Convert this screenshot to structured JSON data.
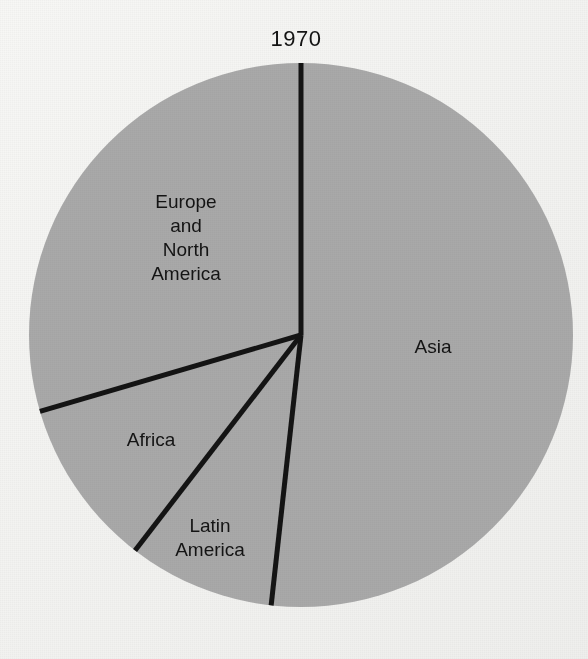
{
  "chart_data": {
    "type": "pie",
    "title": "1970",
    "subtitle": "",
    "xlabel": "",
    "ylabel": "",
    "legend_position": "none",
    "grid": false,
    "labels_inside_slices": true,
    "categories": [
      "Asia",
      "Latin America",
      "Africa",
      "Europe and North America"
    ],
    "values": [
      51.8,
      8.7,
      10.0,
      29.5
    ],
    "units": "percent of total",
    "start_angle_deg": 0,
    "direction": "clockwise",
    "slices": [
      {
        "name": "Asia",
        "label": "Asia",
        "value": 51.8,
        "start_angle_deg": 0.0,
        "end_angle_deg": 186.3,
        "fill": "#a9a9a9"
      },
      {
        "name": "Latin America",
        "label": "Latin\nAmerica",
        "value": 8.7,
        "start_angle_deg": 186.3,
        "end_angle_deg": 217.6,
        "fill": "#a9a9a9"
      },
      {
        "name": "Africa",
        "label": "Africa",
        "value": 10.0,
        "start_angle_deg": 217.6,
        "end_angle_deg": 253.7,
        "fill": "#a9a9a9"
      },
      {
        "name": "Europe and North America",
        "label": "Europe\nand\nNorth\nAmerica",
        "value": 29.5,
        "start_angle_deg": 253.7,
        "end_angle_deg": 360.0,
        "fill": "#a9a9a9"
      }
    ],
    "geometry": {
      "center_x": 301,
      "center_y": 335,
      "radius": 272
    },
    "colors": {
      "slice_fill": "#a9a9a9",
      "divider_line": "#141414",
      "background": "#f6f6f4",
      "text": "#141414"
    }
  }
}
